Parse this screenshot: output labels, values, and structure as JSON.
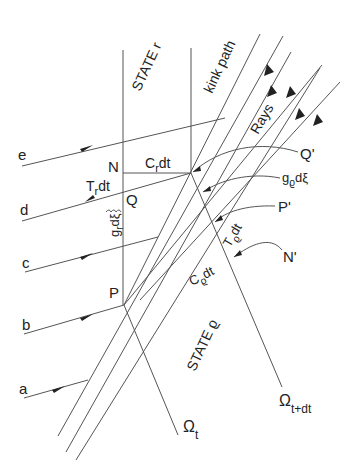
{
  "labels": {
    "state_r": "STATE r",
    "state_rho": "STATE ϱ",
    "kink_path": "kink path",
    "rays": "Rays",
    "N": "N",
    "Q": "Q",
    "P": "P",
    "Q_prime": "Q'",
    "P_prime": "P'",
    "N_prime": "N'",
    "Cr_dt": "C",
    "Cr_sub": "r",
    "Cr_tail": "dt",
    "Tr_dt": "T",
    "Tr_sub": "r",
    "Tr_tail": "dt",
    "gr_dxi": "g",
    "gr_sub": "r",
    "gr_tail": "dξ",
    "grho_dxi": "g",
    "grho_sub": "ϱ",
    "grho_tail": "dξ",
    "Trho_dt": "T",
    "Trho_sub": "ϱ",
    "Trho_tail": "dt",
    "Crho_dt": "C",
    "Crho_sub": "ϱ",
    "Crho_tail": "dt",
    "omega_t": "Ω",
    "omega_t_sub": "t",
    "omega_tdt": "Ω",
    "omega_tdt_sub": "t+dt"
  },
  "incoming_rays": [
    {
      "label": "e"
    },
    {
      "label": "d"
    },
    {
      "label": "c"
    },
    {
      "label": "b"
    },
    {
      "label": "a"
    }
  ],
  "colors": {
    "line": "#555555",
    "text": "#222222"
  }
}
